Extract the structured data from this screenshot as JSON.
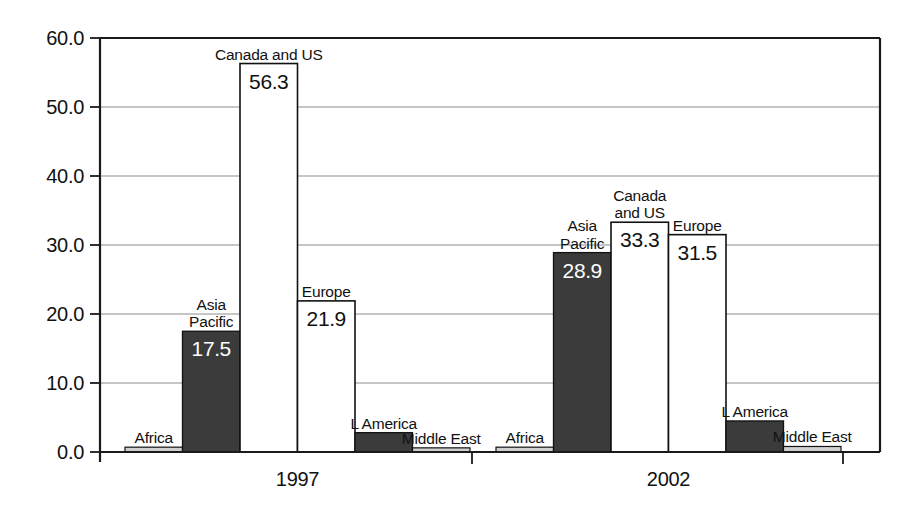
{
  "chart_data": {
    "type": "bar",
    "title": "",
    "subtitle": "",
    "xlabel": "",
    "ylabel": "",
    "ylim": [
      0.0,
      60.0
    ],
    "grid": true,
    "legend_position": "none",
    "categories": [
      "1997",
      "2002"
    ],
    "ytick_labels": [
      "0.0",
      "10.0",
      "20.0",
      "30.0",
      "40.0",
      "50.0",
      "60.0"
    ],
    "ytick_values": [
      0,
      10,
      20,
      30,
      40,
      50,
      60
    ],
    "xtick_labels": [
      "1997",
      "2002"
    ],
    "series_order": [
      "Africa",
      "Asia Pacific",
      "Canada and US",
      "Europe",
      "L America",
      "Middle East"
    ],
    "groups": [
      {
        "category": "1997",
        "bars": [
          {
            "name": "Africa",
            "label": "Africa",
            "label_lines": [
              "Africa"
            ],
            "value": 0.7,
            "value_text": "",
            "show_value": false,
            "fill": "light",
            "value_inside": false
          },
          {
            "name": "Asia Pacific",
            "label": "Asia Pacific",
            "label_lines": [
              "Asia",
              "Pacific"
            ],
            "value": 17.5,
            "value_text": "17.5",
            "show_value": true,
            "fill": "dark",
            "value_inside": true
          },
          {
            "name": "Canada and US",
            "label": "Canada and US",
            "label_lines": [
              "Canada and US"
            ],
            "value": 56.3,
            "value_text": "56.3",
            "show_value": true,
            "fill": "white",
            "value_inside": true
          },
          {
            "name": "Europe",
            "label": "Europe",
            "label_lines": [
              "Europe"
            ],
            "value": 21.9,
            "value_text": "21.9",
            "show_value": true,
            "fill": "white",
            "value_inside": true
          },
          {
            "name": "L America",
            "label": "L America",
            "label_lines": [
              "L America"
            ],
            "value": 2.8,
            "value_text": "",
            "show_value": false,
            "fill": "dark",
            "value_inside": false
          },
          {
            "name": "Middle East",
            "label": "Middle East",
            "label_lines": [
              "Middle East"
            ],
            "value": 0.6,
            "value_text": "",
            "show_value": false,
            "fill": "light",
            "value_inside": false
          }
        ]
      },
      {
        "category": "2002",
        "bars": [
          {
            "name": "Africa",
            "label": "Africa",
            "label_lines": [
              "Africa"
            ],
            "value": 0.7,
            "value_text": "",
            "show_value": false,
            "fill": "light",
            "value_inside": false
          },
          {
            "name": "Asia Pacific",
            "label": "Asia Pacific",
            "label_lines": [
              "Asia",
              "Pacific"
            ],
            "value": 28.9,
            "value_text": "28.9",
            "show_value": true,
            "fill": "dark",
            "value_inside": true
          },
          {
            "name": "Canada and US",
            "label": "Canada and US",
            "label_lines": [
              "Canada",
              "and US"
            ],
            "value": 33.3,
            "value_text": "33.3",
            "show_value": true,
            "fill": "white",
            "value_inside": true
          },
          {
            "name": "Europe",
            "label": "Europe",
            "label_lines": [
              "Europe"
            ],
            "value": 31.5,
            "value_text": "31.5",
            "show_value": true,
            "fill": "white",
            "value_inside": true
          },
          {
            "name": "L America",
            "label": "L America",
            "label_lines": [
              "L America"
            ],
            "value": 4.5,
            "value_text": "",
            "show_value": false,
            "fill": "dark",
            "value_inside": false
          },
          {
            "name": "Middle East",
            "label": "Middle East",
            "label_lines": [
              "Middle East"
            ],
            "value": 0.8,
            "value_text": "",
            "show_value": false,
            "fill": "light",
            "value_inside": false
          }
        ]
      }
    ],
    "colors": {
      "dark": "#3b3b3b",
      "white": "#ffffff",
      "light": "#cfcfcf",
      "outline": "#111111",
      "grid": "#8d8d8d",
      "axis": "#1a1a1a",
      "background": "#ffffff"
    }
  },
  "layout": {
    "plot_left": 100,
    "plot_right": 880,
    "plot_top": 38,
    "plot_bottom": 452,
    "bar_width": 57.5,
    "group_gap": 2,
    "first_bar_left": 125
  }
}
